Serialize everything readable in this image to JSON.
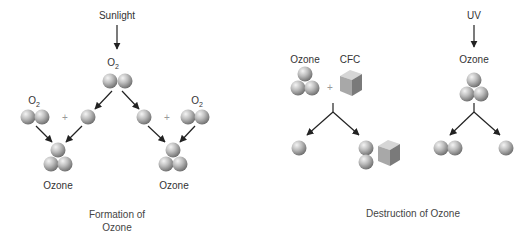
{
  "formation": {
    "energy_label": "Sunlight",
    "top_molecule_label": "O",
    "top_molecule_sub": "2",
    "left_o2_label": "O",
    "left_o2_sub": "2",
    "right_o2_label": "O",
    "right_o2_sub": "2",
    "plus": "+",
    "left_product": "Ozone",
    "right_product": "Ozone",
    "caption_line1": "Formation of",
    "caption_line2": "Ozone"
  },
  "destruction": {
    "cfc_reactant_label": "Ozone",
    "cfc_label": "CFC",
    "plus": "+",
    "uv_label": "UV",
    "uv_reactant_label": "Ozone",
    "caption": "Destruction of Ozone"
  },
  "colors": {
    "arrow": "#222222",
    "sphere_light": "#f2f2f2",
    "sphere_dark": "#6e6e6e",
    "cube_top": "#d6d6d6",
    "cube_left": "#a8a8a8",
    "cube_right": "#7a7a7a"
  }
}
